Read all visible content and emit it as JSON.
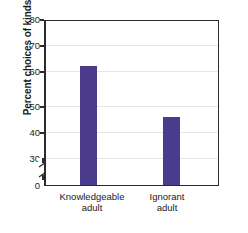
{
  "chart_data": {
    "type": "bar",
    "title": "",
    "xlabel": "",
    "ylabel": "Percent choices of kinds",
    "categories": [
      "Knowledgeable adult",
      "Ignorant adult"
    ],
    "category_lines": [
      [
        "Knowledgeable",
        "adult"
      ],
      [
        "Ignorant",
        "adult"
      ]
    ],
    "values": [
      63.5,
      44.5
    ],
    "ylim": [
      0,
      80
    ],
    "yticks": [
      0,
      30,
      40,
      50,
      60,
      70,
      80
    ],
    "ytick_labels": [
      "0",
      "30",
      "40",
      "50",
      "60",
      "70",
      "80"
    ],
    "axis_break": true,
    "axis_break_between": [
      0,
      30
    ],
    "grid": true,
    "grid_axis": "y",
    "legend": false,
    "bar_color": "#4a3b8c",
    "grid_color": "#e6e6e6",
    "frame_color": "#2b2b2b"
  }
}
